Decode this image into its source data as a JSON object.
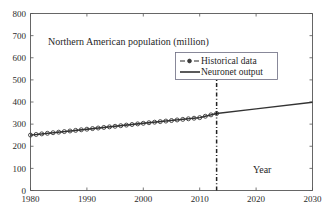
{
  "chart_data": {
    "type": "line",
    "title": "Northern American population (million)",
    "xlabel": "Year",
    "ylabel": "",
    "xlim": [
      1980,
      2030
    ],
    "ylim": [
      0,
      800
    ],
    "grid": false,
    "legend_position": "upper-center-right",
    "xticks": [
      1980,
      1990,
      2000,
      2010,
      2020,
      2030
    ],
    "yticks": [
      0,
      100,
      200,
      300,
      400,
      500,
      600,
      700,
      800
    ],
    "xtick_labels": [
      "1980",
      "1990",
      "2000",
      "2010",
      "2020",
      "2030"
    ],
    "ytick_labels": [
      "0",
      "100",
      "200",
      "300",
      "400",
      "500",
      "600",
      "700",
      "800"
    ],
    "annotations": [
      {
        "name": "split-year",
        "x": 2013,
        "label": "",
        "style": "dash-dot-vertical"
      }
    ],
    "series": [
      {
        "name": "Historical data",
        "style": "dashed-with-circle-markers",
        "color": "#3a3a3a",
        "x": [
          1980,
          1981,
          1982,
          1983,
          1984,
          1985,
          1986,
          1987,
          1988,
          1989,
          1990,
          1991,
          1992,
          1993,
          1994,
          1995,
          1996,
          1997,
          1998,
          1999,
          2000,
          2001,
          2002,
          2003,
          2004,
          2005,
          2006,
          2007,
          2008,
          2009,
          2010,
          2011,
          2012,
          2013
        ],
        "values": [
          250.5,
          253.2,
          255.9,
          258.5,
          261.1,
          263.7,
          266.3,
          269.0,
          271.7,
          274.4,
          277.1,
          279.8,
          282.4,
          285.0,
          287.6,
          290.2,
          292.9,
          295.6,
          298.3,
          301.0,
          303.7,
          306.3,
          308.8,
          311.3,
          313.8,
          316.3,
          318.9,
          321.5,
          324.1,
          326.7,
          329.3,
          335.6,
          341.8,
          348.0
        ]
      },
      {
        "name": "Neuronet output",
        "style": "solid",
        "color": "#333333",
        "x": [
          1980,
          1990,
          2000,
          2010,
          2013,
          2020,
          2030
        ],
        "values": [
          250.5,
          277.1,
          303.7,
          329.3,
          348.0,
          369.0,
          399.0
        ]
      }
    ]
  },
  "legend": {
    "entries": [
      {
        "label": "Historical data",
        "marker": "dashed-circle"
      },
      {
        "label": "Neuronet output",
        "marker": "solid-line"
      }
    ]
  },
  "labels": {
    "title": "Northern American population (million)",
    "x_caption": "Year"
  },
  "colors": {
    "background": "#ffffff",
    "axis": "#555555",
    "historical": "#3a3a3a",
    "neuronet": "#333333",
    "divider": "#222222",
    "legend_border": "#6b6b80",
    "text": "#1f1f1f"
  }
}
